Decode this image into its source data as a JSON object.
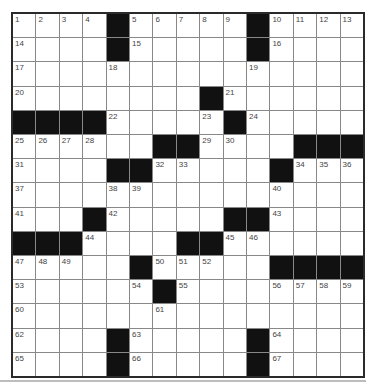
{
  "puzzle": {
    "rows": 15,
    "cols": 15,
    "grid": [
      ".... ..... ....",
      ".... ..... ....",
      "...............",
      "........ ......",
      "    .... ......",
      "......  ...   .",
      ".... ...... ...",
      "...............",
      "... ..... ... .",
      "   ... ........",
      "..... ...     .",
      "...... ........",
      "...............",
      ".... ..... ....",
      ".... ..... ...."
    ],
    "blacks": [
      [
        0,
        4
      ],
      [
        0,
        10
      ],
      [
        1,
        4
      ],
      [
        1,
        10
      ],
      [
        3,
        8
      ],
      [
        4,
        0
      ],
      [
        4,
        1
      ],
      [
        4,
        2
      ],
      [
        4,
        3
      ],
      [
        4,
        9
      ],
      [
        5,
        6
      ],
      [
        5,
        7
      ],
      [
        5,
        12
      ],
      [
        5,
        13
      ],
      [
        5,
        14
      ],
      [
        6,
        4
      ],
      [
        6,
        5
      ],
      [
        6,
        11
      ],
      [
        8,
        3
      ],
      [
        8,
        9
      ],
      [
        8,
        10
      ],
      [
        9,
        0
      ],
      [
        9,
        1
      ],
      [
        9,
        2
      ],
      [
        9,
        7
      ],
      [
        9,
        8
      ],
      [
        10,
        5
      ],
      [
        10,
        11
      ],
      [
        10,
        12
      ],
      [
        10,
        13
      ],
      [
        10,
        14
      ],
      [
        11,
        6
      ],
      [
        13,
        4
      ],
      [
        13,
        10
      ],
      [
        14,
        4
      ],
      [
        14,
        10
      ]
    ],
    "numbers": [
      {
        "r": 0,
        "c": 0,
        "n": "1"
      },
      {
        "r": 0,
        "c": 1,
        "n": "2"
      },
      {
        "r": 0,
        "c": 2,
        "n": "3"
      },
      {
        "r": 0,
        "c": 3,
        "n": "4"
      },
      {
        "r": 0,
        "c": 5,
        "n": "5"
      },
      {
        "r": 0,
        "c": 6,
        "n": "6"
      },
      {
        "r": 0,
        "c": 7,
        "n": "7"
      },
      {
        "r": 0,
        "c": 8,
        "n": "8"
      },
      {
        "r": 0,
        "c": 9,
        "n": "9"
      },
      {
        "r": 0,
        "c": 11,
        "n": "10"
      },
      {
        "r": 0,
        "c": 12,
        "n": "11"
      },
      {
        "r": 0,
        "c": 13,
        "n": "12"
      },
      {
        "r": 0,
        "c": 14,
        "n": "13"
      },
      {
        "r": 1,
        "c": 0,
        "n": "14"
      },
      {
        "r": 1,
        "c": 5,
        "n": "15"
      },
      {
        "r": 1,
        "c": 11,
        "n": "16"
      },
      {
        "r": 2,
        "c": 0,
        "n": "17"
      },
      {
        "r": 2,
        "c": 4,
        "n": "18"
      },
      {
        "r": 2,
        "c": 10,
        "n": "19"
      },
      {
        "r": 3,
        "c": 0,
        "n": "20"
      },
      {
        "r": 3,
        "c": 9,
        "n": "21"
      },
      {
        "r": 4,
        "c": 4,
        "n": "22"
      },
      {
        "r": 4,
        "c": 8,
        "n": "23"
      },
      {
        "r": 4,
        "c": 10,
        "n": "24"
      },
      {
        "r": 5,
        "c": 0,
        "n": "25"
      },
      {
        "r": 5,
        "c": 1,
        "n": "26"
      },
      {
        "r": 5,
        "c": 2,
        "n": "27"
      },
      {
        "r": 5,
        "c": 3,
        "n": "28"
      },
      {
        "r": 5,
        "c": 8,
        "n": "29"
      },
      {
        "r": 5,
        "c": 9,
        "n": "30"
      },
      {
        "r": 6,
        "c": 0,
        "n": "31"
      },
      {
        "r": 6,
        "c": 6,
        "n": "32"
      },
      {
        "r": 6,
        "c": 7,
        "n": "33"
      },
      {
        "r": 6,
        "c": 12,
        "n": "34"
      },
      {
        "r": 6,
        "c": 13,
        "n": "35"
      },
      {
        "r": 6,
        "c": 14,
        "n": "36"
      },
      {
        "r": 7,
        "c": 0,
        "n": "37"
      },
      {
        "r": 7,
        "c": 4,
        "n": "38"
      },
      {
        "r": 7,
        "c": 5,
        "n": "39"
      },
      {
        "r": 7,
        "c": 11,
        "n": "40"
      },
      {
        "r": 8,
        "c": 0,
        "n": "41"
      },
      {
        "r": 8,
        "c": 4,
        "n": "42"
      },
      {
        "r": 8,
        "c": 11,
        "n": "43"
      },
      {
        "r": 9,
        "c": 3,
        "n": "44"
      },
      {
        "r": 9,
        "c": 9,
        "n": "45"
      },
      {
        "r": 9,
        "c": 10,
        "n": "46"
      },
      {
        "r": 10,
        "c": 0,
        "n": "47"
      },
      {
        "r": 10,
        "c": 1,
        "n": "48"
      },
      {
        "r": 10,
        "c": 2,
        "n": "49"
      },
      {
        "r": 10,
        "c": 6,
        "n": "50"
      },
      {
        "r": 10,
        "c": 7,
        "n": "51"
      },
      {
        "r": 10,
        "c": 8,
        "n": "52"
      },
      {
        "r": 11,
        "c": 0,
        "n": "53"
      },
      {
        "r": 11,
        "c": 5,
        "n": "54"
      },
      {
        "r": 11,
        "c": 7,
        "n": "55"
      },
      {
        "r": 11,
        "c": 11,
        "n": "56"
      },
      {
        "r": 11,
        "c": 12,
        "n": "57"
      },
      {
        "r": 11,
        "c": 13,
        "n": "58"
      },
      {
        "r": 11,
        "c": 14,
        "n": "59"
      },
      {
        "r": 12,
        "c": 0,
        "n": "60"
      },
      {
        "r": 12,
        "c": 6,
        "n": "61"
      },
      {
        "r": 13,
        "c": 0,
        "n": "62"
      },
      {
        "r": 13,
        "c": 5,
        "n": "63"
      },
      {
        "r": 13,
        "c": 11,
        "n": "64"
      },
      {
        "r": 14,
        "c": 0,
        "n": "65"
      },
      {
        "r": 14,
        "c": 5,
        "n": "66"
      },
      {
        "r": 14,
        "c": 11,
        "n": "67"
      }
    ]
  },
  "colors": {
    "black_square": "#111111",
    "white_square": "#ffffff",
    "grid_line": "#888888",
    "border": "#2a2a2a",
    "number_text": "#444444"
  }
}
